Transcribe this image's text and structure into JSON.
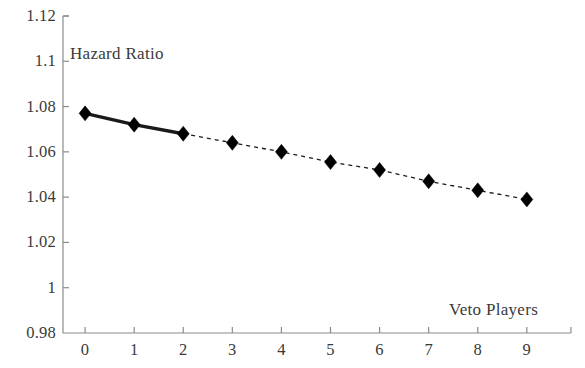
{
  "chart_data": {
    "type": "line",
    "title": "",
    "xlabel": "Veto Players",
    "ylabel": "Hazard Ratio",
    "x": [
      0,
      1,
      2,
      3,
      4,
      5,
      6,
      7,
      8,
      9
    ],
    "values": [
      1.077,
      1.072,
      1.068,
      1.064,
      1.06,
      1.0555,
      1.052,
      1.047,
      1.043,
      1.039
    ],
    "series": [
      {
        "name": "Hazard Ratio",
        "values": [
          1.077,
          1.072,
          1.068,
          1.064,
          1.06,
          1.0555,
          1.052,
          1.047,
          1.043,
          1.039
        ]
      }
    ],
    "xlim": [
      -0.45,
      9.9
    ],
    "ylim": [
      0.98,
      1.12
    ],
    "xticks": [
      0,
      1,
      2,
      3,
      4,
      5,
      6,
      7,
      8,
      9
    ],
    "yticks": [
      0.98,
      1,
      1.02,
      1.04,
      1.06,
      1.08,
      1.1,
      1.12
    ],
    "xtick_labels": [
      "0",
      "1",
      "2",
      "3",
      "4",
      "5",
      "6",
      "7",
      "8",
      "9"
    ],
    "ytick_labels": [
      "0.98",
      "1",
      "1.02",
      "1.04",
      "1.06",
      "1.08",
      "1.1",
      "1.12"
    ],
    "grid": false,
    "legend": "none",
    "marker": "diamond",
    "marker_color": "#000000",
    "line_color": "#1a1a1a",
    "solid_segment_x": [
      0,
      2
    ],
    "dashed_segment_x": [
      2,
      9
    ],
    "axis_color": "#8c8c8c",
    "background_color": "#ffffff"
  },
  "axes": {
    "y_title": "Hazard Ratio",
    "x_title": "Veto Players"
  }
}
